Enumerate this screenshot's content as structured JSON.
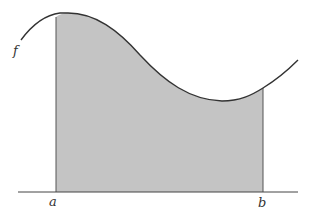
{
  "diagram": {
    "curve_label": "f",
    "lower_bound_label": "a",
    "upper_bound_label": "b",
    "colors": {
      "curve": "#333333",
      "shade": "#c4c4c4",
      "axis": "#444444",
      "background": "#ffffff"
    }
  }
}
